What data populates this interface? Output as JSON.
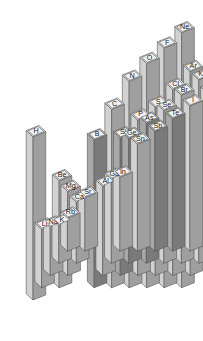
{
  "figure": {
    "background_color": "#ffffff",
    "projection": "isometric"
  },
  "style": {
    "face_top": "#e8e8e8",
    "face_left": "#d2d2d2",
    "face_right": "#9f9f9f",
    "face_top_dark": "#bdbdbd",
    "face_left_dark": "#a8a8a8",
    "face_right_dark": "#7a7a7a",
    "outline": "#555555",
    "label_fill": "#f2f2f2",
    "label_text": "#1a1a1a"
  },
  "legend": {
    "categories": [
      {
        "name": "main-group",
        "shade": "light"
      },
      {
        "name": "metalloid",
        "shade": "dark"
      }
    ]
  },
  "chart_data": {
    "type": "bar",
    "xlabel": "Group",
    "ylabel": "Period",
    "zlabel": "Value",
    "grid": false,
    "legend_position": "none",
    "groups": [
      1,
      2,
      13,
      14,
      15,
      16,
      17,
      18
    ],
    "periods": [
      1,
      2,
      3,
      4,
      5
    ],
    "zlim": [
      0,
      100
    ],
    "points": [
      {
        "label": "H",
        "group": 1,
        "period": 1,
        "value": 64,
        "shade": "light"
      },
      {
        "label": "Li",
        "group": 1,
        "period": 2,
        "value": 23,
        "shade": "light"
      },
      {
        "label": "Na",
        "group": 1,
        "period": 3,
        "value": 19,
        "shade": "light"
      },
      {
        "label": "K",
        "group": 1,
        "period": 4,
        "value": 15,
        "shade": "light"
      },
      {
        "label": "Rb",
        "group": 1,
        "period": 5,
        "value": 13,
        "shade": "light"
      },
      {
        "label": "Be",
        "group": 2,
        "period": 2,
        "value": 42,
        "shade": "light"
      },
      {
        "label": "Mg",
        "group": 2,
        "period": 3,
        "value": 33,
        "shade": "light"
      },
      {
        "label": "Ca",
        "group": 2,
        "period": 4,
        "value": 24,
        "shade": "light"
      },
      {
        "label": "Sr",
        "group": 2,
        "period": 5,
        "value": 21,
        "shade": "light"
      },
      {
        "label": "B",
        "group": 13,
        "period": 2,
        "value": 58,
        "shade": "dark"
      },
      {
        "label": "Al",
        "group": 13,
        "period": 3,
        "value": 35,
        "shade": "light"
      },
      {
        "label": "Ga",
        "group": 13,
        "period": 4,
        "value": 33,
        "shade": "light"
      },
      {
        "label": "In",
        "group": 13,
        "period": 5,
        "value": 29,
        "shade": "light"
      },
      {
        "label": "C",
        "group": 14,
        "period": 2,
        "value": 70,
        "shade": "light"
      },
      {
        "label": "Si",
        "group": 14,
        "period": 3,
        "value": 54,
        "shade": "dark"
      },
      {
        "label": "Ge",
        "group": 14,
        "period": 4,
        "value": 49,
        "shade": "dark"
      },
      {
        "label": "Sn",
        "group": 14,
        "period": 5,
        "value": 42,
        "shade": "light"
      },
      {
        "label": "N",
        "group": 15,
        "period": 2,
        "value": 81,
        "shade": "light"
      },
      {
        "label": "P",
        "group": 15,
        "period": 3,
        "value": 61,
        "shade": "light"
      },
      {
        "label": "As",
        "group": 15,
        "period": 4,
        "value": 55,
        "shade": "dark"
      },
      {
        "label": "Sb",
        "group": 15,
        "period": 5,
        "value": 47,
        "shade": "dark"
      },
      {
        "label": "O",
        "group": 16,
        "period": 2,
        "value": 88,
        "shade": "light"
      },
      {
        "label": "S",
        "group": 16,
        "period": 3,
        "value": 66,
        "shade": "light"
      },
      {
        "label": "Se",
        "group": 16,
        "period": 4,
        "value": 60,
        "shade": "light"
      },
      {
        "label": "Te",
        "group": 16,
        "period": 5,
        "value": 52,
        "shade": "dark"
      },
      {
        "label": "F",
        "group": 17,
        "period": 2,
        "value": 94,
        "shade": "light"
      },
      {
        "label": "Cl",
        "group": 17,
        "period": 3,
        "value": 73,
        "shade": "light"
      },
      {
        "label": "Br",
        "group": 17,
        "period": 4,
        "value": 66,
        "shade": "light"
      },
      {
        "label": "I",
        "group": 17,
        "period": 5,
        "value": 57,
        "shade": "light"
      },
      {
        "label": "Ne",
        "group": 18,
        "period": 2,
        "value": 100,
        "shade": "light"
      },
      {
        "label": "Ar",
        "group": 18,
        "period": 3,
        "value": 80,
        "shade": "light"
      },
      {
        "label": "Kr",
        "group": 18,
        "period": 4,
        "value": 72,
        "shade": "light"
      },
      {
        "label": "Xe",
        "group": 18,
        "period": 5,
        "value": 62,
        "shade": "light"
      }
    ]
  }
}
